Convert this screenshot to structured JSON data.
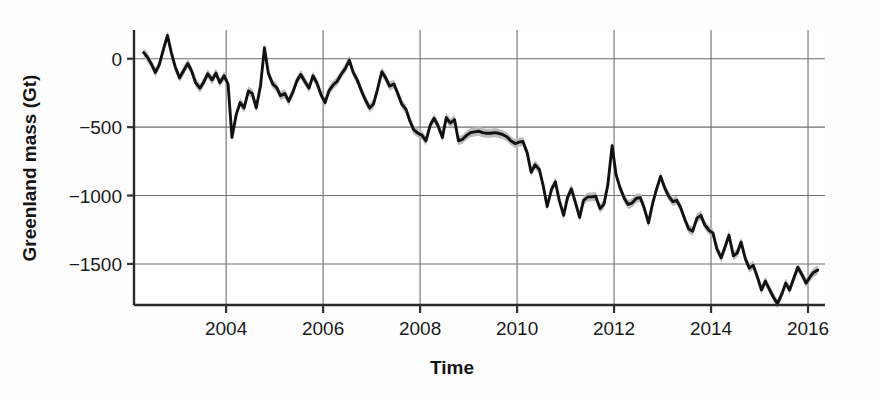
{
  "chart_data": {
    "type": "line",
    "title": "",
    "subtitle": "",
    "xlabel": "Time",
    "ylabel": "Greenland mass (Gt)",
    "xlim": [
      2002.1,
      2016.35
    ],
    "ylim": [
      -1800,
      210
    ],
    "xticks": [
      2004,
      2006,
      2008,
      2010,
      2012,
      2014,
      2016
    ],
    "xtick_labels": [
      "2004",
      "2006",
      "2008",
      "2010",
      "2012",
      "2014",
      "2016"
    ],
    "yticks": [
      0,
      -500,
      -1000,
      -1500
    ],
    "ytick_labels": [
      "0",
      "-500",
      "-1000",
      "-1500"
    ],
    "grid": true,
    "legend": false,
    "legend_position": "none",
    "line_color": "#111111",
    "band_color": "#b9b9b9",
    "band_label": "uncertainty envelope",
    "series": [
      {
        "name": "Greenland mass anomaly",
        "units": "Gt",
        "x": [
          2002.3,
          2002.38,
          2002.46,
          2002.54,
          2002.62,
          2002.7,
          2002.79,
          2002.87,
          2002.95,
          2003.04,
          2003.12,
          2003.21,
          2003.29,
          2003.37,
          2003.46,
          2003.54,
          2003.62,
          2003.71,
          2003.79,
          2003.87,
          2003.96,
          2004.04,
          2004.12,
          2004.21,
          2004.29,
          2004.37,
          2004.46,
          2004.54,
          2004.62,
          2004.71,
          2004.79,
          2004.87,
          2004.96,
          2005.04,
          2005.12,
          2005.21,
          2005.29,
          2005.37,
          2005.46,
          2005.54,
          2005.62,
          2005.71,
          2005.79,
          2005.87,
          2005.96,
          2006.04,
          2006.12,
          2006.21,
          2006.29,
          2006.37,
          2006.46,
          2006.54,
          2006.62,
          2006.71,
          2006.79,
          2006.87,
          2006.96,
          2007.04,
          2007.12,
          2007.21,
          2007.29,
          2007.37,
          2007.46,
          2007.54,
          2007.62,
          2007.71,
          2007.79,
          2007.87,
          2007.96,
          2008.04,
          2008.12,
          2008.21,
          2008.29,
          2008.37,
          2008.46,
          2008.54,
          2008.62,
          2008.71,
          2008.79,
          2008.87,
          2008.96,
          2009.04,
          2009.12,
          2009.21,
          2009.29,
          2009.37,
          2009.46,
          2009.54,
          2009.62,
          2009.71,
          2009.79,
          2009.87,
          2009.96,
          2010.04,
          2010.12,
          2010.21,
          2010.29,
          2010.37,
          2010.46,
          2010.54,
          2010.62,
          2010.71,
          2010.79,
          2010.87,
          2010.96,
          2011.04,
          2011.12,
          2011.21,
          2011.29,
          2011.37,
          2011.46,
          2011.54,
          2011.62,
          2011.71,
          2011.79,
          2011.87,
          2011.96,
          2012.04,
          2012.12,
          2012.21,
          2012.29,
          2012.37,
          2012.46,
          2012.54,
          2012.62,
          2012.71,
          2012.79,
          2012.87,
          2012.96,
          2013.04,
          2013.12,
          2013.21,
          2013.29,
          2013.37,
          2013.46,
          2013.54,
          2013.62,
          2013.71,
          2013.79,
          2013.87,
          2013.96,
          2014.04,
          2014.12,
          2014.21,
          2014.29,
          2014.37,
          2014.46,
          2014.54,
          2014.62,
          2014.71,
          2014.79,
          2014.87,
          2014.96,
          2015.04,
          2015.12,
          2015.21,
          2015.29,
          2015.37,
          2015.46,
          2015.54,
          2015.62,
          2015.71,
          2015.79,
          2015.87,
          2015.96,
          2016.04,
          2016.12,
          2016.2
        ],
        "y": [
          45,
          10,
          -40,
          -100,
          -45,
          60,
          170,
          45,
          -60,
          -140,
          -90,
          -35,
          -90,
          -175,
          -215,
          -170,
          -110,
          -155,
          -105,
          -175,
          -125,
          -185,
          -575,
          -405,
          -320,
          -360,
          -235,
          -255,
          -360,
          -195,
          80,
          -105,
          -185,
          -210,
          -270,
          -255,
          -310,
          -250,
          -160,
          -115,
          -165,
          -215,
          -125,
          -175,
          -265,
          -320,
          -235,
          -190,
          -165,
          -115,
          -70,
          -10,
          -100,
          -160,
          -235,
          -300,
          -360,
          -330,
          -225,
          -95,
          -140,
          -200,
          -185,
          -255,
          -330,
          -370,
          -455,
          -520,
          -545,
          -560,
          -600,
          -485,
          -435,
          -490,
          -575,
          -430,
          -470,
          -445,
          -600,
          -590,
          -560,
          -540,
          -535,
          -530,
          -540,
          -545,
          -545,
          -540,
          -545,
          -555,
          -570,
          -600,
          -620,
          -610,
          -605,
          -690,
          -830,
          -775,
          -810,
          -930,
          -1080,
          -955,
          -900,
          -1035,
          -1145,
          -1015,
          -950,
          -1060,
          -1160,
          -1035,
          -1010,
          -1010,
          -1005,
          -1095,
          -1065,
          -925,
          -635,
          -845,
          -940,
          -1020,
          -1065,
          -1055,
          -1020,
          -1015,
          -1090,
          -1200,
          -1065,
          -960,
          -860,
          -940,
          -1000,
          -1045,
          -1035,
          -1085,
          -1175,
          -1245,
          -1260,
          -1165,
          -1145,
          -1215,
          -1255,
          -1275,
          -1390,
          -1455,
          -1375,
          -1290,
          -1440,
          -1420,
          -1340,
          -1465,
          -1530,
          -1510,
          -1600,
          -1690,
          -1625,
          -1690,
          -1745,
          -1790,
          -1720,
          -1640,
          -1690,
          -1600,
          -1525,
          -1575,
          -1640,
          -1595,
          -1560,
          -1545
        ],
        "uncertainty": 33
      }
    ]
  },
  "figure": {
    "background_color": "#ffffff",
    "axis_color": "#333333",
    "grid_color": "#6e6e6e"
  }
}
